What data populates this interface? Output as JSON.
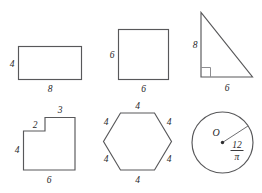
{
  "figure": {
    "background_color": "#ffffff",
    "stroke_color": "#58585a",
    "label_color": "#28282a",
    "marker_color": "#8d8d90",
    "layout": {
      "rows": 2,
      "columns": 3
    }
  },
  "shapes": [
    {
      "id": "rectangle",
      "name": "rectangle",
      "labels": {
        "left": "4",
        "bottom": "8"
      }
    },
    {
      "id": "square",
      "name": "square",
      "labels": {
        "left": "6",
        "bottom": "6"
      }
    },
    {
      "id": "right-triangle",
      "name": "right triangle",
      "labels": {
        "left": "8",
        "bottom": "6"
      },
      "marker": "right-angle"
    },
    {
      "id": "l-shape",
      "name": "L-shaped hexagon",
      "labels": {
        "top": "3",
        "step": "2",
        "left": "4",
        "bottom": "6"
      }
    },
    {
      "id": "hexagon",
      "name": "regular hexagon",
      "labels": {
        "top": "4",
        "upper_right": "4",
        "lower_right": "4",
        "bottom": "4",
        "lower_left": "4",
        "upper_left": "4"
      }
    },
    {
      "id": "circle",
      "name": "circle",
      "labels": {
        "center": "O",
        "radius_numerator": "12",
        "radius_denominator": "π"
      }
    }
  ]
}
